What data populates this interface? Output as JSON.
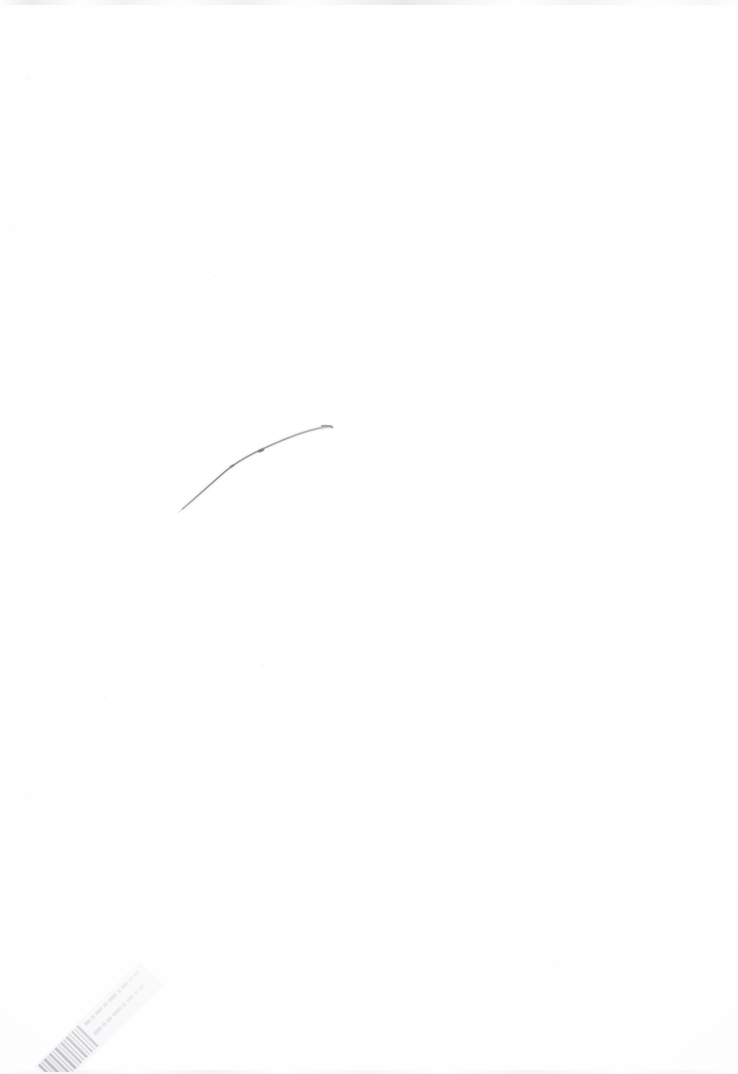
{
  "image": {
    "title": "Scanned blank sheet with pencil arc",
    "kind": "scanned-paper",
    "width_px": 738,
    "height_px": 1074,
    "background_color": "#ffffff",
    "paper_tone": "#fefefe",
    "visible_text": ""
  },
  "artifacts": {
    "pencil_arc": {
      "name": "pencil-arc",
      "description": "A single thin hand-drawn curved pencil line arcing up from lower-left to a blunt rounded end at upper-right",
      "stroke_color": "#8c8c90",
      "stroke_color_light": "#c6c6ca",
      "start_point": [
        182,
        509
      ],
      "end_point": [
        332,
        427
      ],
      "apex_point": [
        312,
        425
      ],
      "bounding_box": [
        178,
        420,
        158,
        92
      ],
      "stroke_width_min_px": 0.6,
      "stroke_width_max_px": 2.2,
      "label": ""
    },
    "barcode_label": {
      "name": "archive-barcode-label",
      "description": "Very faint diagonal adhesive barcode/accession label in the lower-left corner, rotated about -45 degrees, mostly illegible",
      "rotation_deg": -45,
      "ink_color": "#dcdce0",
      "bar_color": "#c9c9cf",
      "bounding_box": [
        30,
        925,
        150,
        140
      ],
      "legible_text": "",
      "text_line_1": "",
      "text_line_2": ""
    },
    "scan_noise": {
      "name": "scan-edge-noise",
      "description": "Faint grey scanner banding along the top and bottom edges plus scattered dust specks",
      "color": "#e6e6ea"
    }
  },
  "specks": [
    {
      "x": 29,
      "y": 79,
      "r": 1.1,
      "o": 0.45
    },
    {
      "x": 11,
      "y": 225,
      "r": 0.9,
      "o": 0.35
    },
    {
      "x": 214,
      "y": 276,
      "r": 1.0,
      "o": 0.4
    },
    {
      "x": 138,
      "y": 288,
      "r": 0.8,
      "o": 0.3
    },
    {
      "x": 475,
      "y": 174,
      "r": 1.1,
      "o": 0.38
    },
    {
      "x": 426,
      "y": 329,
      "r": 0.9,
      "o": 0.33
    },
    {
      "x": 71,
      "y": 437,
      "r": 1.0,
      "o": 0.36
    },
    {
      "x": 262,
      "y": 666,
      "r": 1.2,
      "o": 0.5
    },
    {
      "x": 90,
      "y": 679,
      "r": 0.9,
      "o": 0.3
    },
    {
      "x": 105,
      "y": 697,
      "r": 1.0,
      "o": 0.34
    },
    {
      "x": 176,
      "y": 696,
      "r": 0.8,
      "o": 0.28
    },
    {
      "x": 369,
      "y": 765,
      "r": 1.0,
      "o": 0.32
    },
    {
      "x": 27,
      "y": 797,
      "r": 0.9,
      "o": 0.3
    },
    {
      "x": 194,
      "y": 766,
      "r": 0.8,
      "o": 0.26
    },
    {
      "x": 558,
      "y": 962,
      "r": 1.0,
      "o": 0.3
    },
    {
      "x": 516,
      "y": 963,
      "r": 0.9,
      "o": 0.27
    },
    {
      "x": 283,
      "y": 877,
      "r": 0.9,
      "o": 0.28
    },
    {
      "x": 660,
      "y": 1000,
      "r": 1.0,
      "o": 0.26
    },
    {
      "x": 494,
      "y": 295,
      "r": 0.9,
      "o": 0.3
    },
    {
      "x": 646,
      "y": 152,
      "r": 1.0,
      "o": 0.28
    },
    {
      "x": 458,
      "y": 16,
      "r": 1.1,
      "o": 0.34
    },
    {
      "x": 401,
      "y": 18,
      "r": 0.9,
      "o": 0.3
    },
    {
      "x": 653,
      "y": 529,
      "r": 0.9,
      "o": 0.25
    },
    {
      "x": 486,
      "y": 871,
      "r": 0.8,
      "o": 0.26
    },
    {
      "x": 515,
      "y": 454,
      "r": 0.9,
      "o": 0.24
    }
  ]
}
